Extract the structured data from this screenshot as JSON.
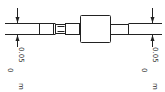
{
  "drawing": {
    "type": "shaft technical drawing",
    "stroke_color": "#222222",
    "left_dimension": {
      "tolerance": "0.05",
      "base": "0",
      "unit": "m"
    },
    "right_dimension": {
      "tolerance": "0.05",
      "base": "0",
      "unit": "m"
    }
  }
}
